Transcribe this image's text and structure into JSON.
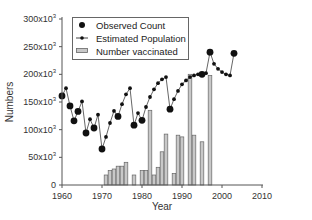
{
  "chart_data": {
    "type": "bar+line+scatter",
    "title": "",
    "xlabel": "Year",
    "ylabel": "Numbers",
    "xlim": [
      1960,
      2010
    ],
    "ylim": [
      0,
      300000
    ],
    "x_ticks": [
      "1960",
      "1970",
      "1980",
      "1990",
      "2000",
      "2010"
    ],
    "y_ticks": [
      {
        "base": "0",
        "exp": ""
      },
      {
        "base": "50x10",
        "exp": "3"
      },
      {
        "base": "100x10",
        "exp": "3"
      },
      {
        "base": "150x10",
        "exp": "3"
      },
      {
        "base": "200x10",
        "exp": "3"
      },
      {
        "base": "250x10",
        "exp": "3"
      },
      {
        "base": "300x10",
        "exp": "3"
      }
    ],
    "grid": false,
    "legend_position": "upper-left",
    "legend": [
      "Observed Count",
      "Estimated Population",
      "Number vaccinated"
    ],
    "series": [
      {
        "name": "Observed Count",
        "type": "scatter",
        "marker": "large-filled-circle",
        "points": [
          [
            1960,
            161000
          ],
          [
            1962,
            143000
          ],
          [
            1963,
            116000
          ],
          [
            1964,
            133000
          ],
          [
            1966,
            94000
          ],
          [
            1968,
            103000
          ],
          [
            1970,
            65000
          ],
          [
            1974,
            124000
          ],
          [
            1978,
            108000
          ],
          [
            1980,
            117000
          ],
          [
            1987,
            137000
          ],
          [
            1995,
            200000
          ],
          [
            1997,
            240000
          ],
          [
            2003,
            238000
          ]
        ]
      },
      {
        "name": "Estimated Population",
        "type": "line",
        "marker": "small-filled-circle",
        "points": [
          [
            1960,
            161000
          ],
          [
            1961,
            175000
          ],
          [
            1962,
            143000
          ],
          [
            1963,
            116000
          ],
          [
            1964,
            133000
          ],
          [
            1965,
            151000
          ],
          [
            1966,
            94000
          ],
          [
            1967,
            119000
          ],
          [
            1968,
            103000
          ],
          [
            1969,
            127000
          ],
          [
            1970,
            65000
          ],
          [
            1971,
            87000
          ],
          [
            1972,
            112000
          ],
          [
            1973,
            134000
          ],
          [
            1974,
            124000
          ],
          [
            1975,
            146000
          ],
          [
            1976,
            164000
          ],
          [
            1977,
            175000
          ],
          [
            1978,
            108000
          ],
          [
            1979,
            130000
          ],
          [
            1980,
            117000
          ],
          [
            1981,
            141000
          ],
          [
            1982,
            159000
          ],
          [
            1983,
            173000
          ],
          [
            1984,
            184000
          ],
          [
            1985,
            191000
          ],
          [
            1986,
            195000
          ],
          [
            1987,
            137000
          ],
          [
            1988,
            155000
          ],
          [
            1989,
            170000
          ],
          [
            1990,
            182000
          ],
          [
            1991,
            189000
          ],
          [
            1992,
            195000
          ],
          [
            1993,
            198000
          ],
          [
            1994,
            200000
          ],
          [
            1995,
            200000
          ],
          [
            1996,
            202000
          ],
          [
            1997,
            240000
          ],
          [
            1998,
            219000
          ],
          [
            1999,
            210000
          ],
          [
            2000,
            204000
          ],
          [
            2001,
            200000
          ],
          [
            2002,
            198000
          ],
          [
            2003,
            238000
          ]
        ]
      },
      {
        "name": "Number vaccinated",
        "type": "bar",
        "points": [
          [
            1971,
            18000
          ],
          [
            1972,
            26000
          ],
          [
            1973,
            29000
          ],
          [
            1974,
            34000
          ],
          [
            1975,
            34000
          ],
          [
            1976,
            41000
          ],
          [
            1978,
            18000
          ],
          [
            1980,
            26000
          ],
          [
            1981,
            26000
          ],
          [
            1982,
            135000
          ],
          [
            1983,
            18000
          ],
          [
            1984,
            32000
          ],
          [
            1985,
            60000
          ],
          [
            1986,
            92000
          ],
          [
            1988,
            21000
          ],
          [
            1989,
            90000
          ],
          [
            1990,
            87000
          ],
          [
            1992,
            200000
          ],
          [
            1993,
            90000
          ],
          [
            1995,
            78000
          ],
          [
            1997,
            198000
          ]
        ]
      }
    ]
  },
  "colors": {
    "axis": "#555555",
    "line": "#555555",
    "marker": "#111111",
    "bar_fill": "#c8c8c8",
    "bar_stroke": "#666666"
  }
}
